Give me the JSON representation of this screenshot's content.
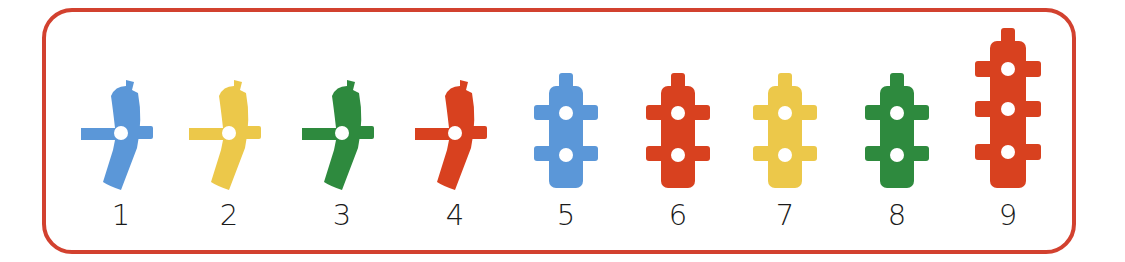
{
  "frame": {
    "border_color": "#d2412f"
  },
  "pieces": [
    {
      "number": "1",
      "shape": "curved-one-hole",
      "color": "#5b97d8",
      "center_x": 121
    },
    {
      "number": "2",
      "shape": "curved-one-hole",
      "color": "#ecc84a",
      "center_x": 229
    },
    {
      "number": "3",
      "shape": "curved-one-hole",
      "color": "#2e8a3e",
      "center_x": 342
    },
    {
      "number": "4",
      "shape": "curved-one-hole",
      "color": "#d8411f",
      "center_x": 455
    },
    {
      "number": "5",
      "shape": "straight-two-holes",
      "color": "#5b97d8",
      "center_x": 566
    },
    {
      "number": "6",
      "shape": "straight-two-holes",
      "color": "#d8411f",
      "center_x": 678
    },
    {
      "number": "7",
      "shape": "straight-two-holes",
      "color": "#ecc84a",
      "center_x": 785
    },
    {
      "number": "8",
      "shape": "straight-two-holes",
      "color": "#2e8a3e",
      "center_x": 897
    },
    {
      "number": "9",
      "shape": "straight-three-holes",
      "color": "#d8411f",
      "center_x": 1008
    }
  ]
}
